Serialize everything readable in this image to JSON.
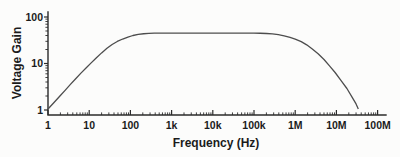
{
  "figure": {
    "background": "#fcfcfb",
    "axis_color": "#2b2b2b",
    "curve_color": "#4d4d4d",
    "text_color": "#1b1b1b"
  },
  "chart_data": {
    "type": "line",
    "scale": "log-log",
    "title": "",
    "xlabel": "Frequency (Hz)",
    "ylabel": "Voltage Gain",
    "x_tick_labels": [
      "1",
      "10",
      "100",
      "1k",
      "10k",
      "100k",
      "1M",
      "10M",
      "100M"
    ],
    "x_tick_values": [
      1,
      10,
      100,
      1000,
      10000,
      100000,
      1000000,
      10000000,
      100000000
    ],
    "y_tick_labels": [
      "1",
      "10",
      "100"
    ],
    "y_tick_values": [
      1,
      10,
      100
    ],
    "xlim": [
      1,
      100000000
    ],
    "ylim": [
      1,
      130
    ],
    "grid": false,
    "legend": false,
    "midband_gain": 45,
    "series": [
      {
        "name": "voltage-gain-response",
        "points": [
          [
            1,
            1.05
          ],
          [
            1.4,
            1.45
          ],
          [
            1.9,
            1.95
          ],
          [
            2.6,
            2.65
          ],
          [
            3.5,
            3.55
          ],
          [
            4.7,
            4.7
          ],
          [
            6.3,
            6.2
          ],
          [
            8.5,
            8.1
          ],
          [
            11,
            10.2
          ],
          [
            15,
            13.3
          ],
          [
            20,
            16.9
          ],
          [
            27,
            21.2
          ],
          [
            36,
            25.6
          ],
          [
            48,
            29.8
          ],
          [
            65,
            33.6
          ],
          [
            87,
            36.9
          ],
          [
            115,
            40.0
          ],
          [
            155,
            42.2
          ],
          [
            210,
            43.6
          ],
          [
            280,
            44.4
          ],
          [
            380,
            44.8
          ],
          [
            520,
            45
          ],
          [
            700,
            45
          ],
          [
            1000,
            45
          ],
          [
            3000,
            45
          ],
          [
            10000,
            45
          ],
          [
            30000,
            45
          ],
          [
            70000,
            45
          ],
          [
            100000,
            44.9
          ],
          [
            140000,
            44.7
          ],
          [
            200000,
            44.2
          ],
          [
            280000,
            43.2
          ],
          [
            390000,
            41.6
          ],
          [
            540000,
            39.4
          ],
          [
            750000,
            36.6
          ],
          [
            1000000,
            33.6
          ],
          [
            1400000,
            29.6
          ],
          [
            1900000,
            25.2
          ],
          [
            2600000,
            20.6
          ],
          [
            3600000,
            16.2
          ],
          [
            5000000,
            12.2
          ],
          [
            6800000,
            8.9
          ],
          [
            9300000,
            6.4
          ],
          [
            13000000,
            4.3
          ],
          [
            18000000,
            2.9
          ],
          [
            24000000,
            1.9
          ],
          [
            30000000,
            1.35
          ],
          [
            34000000,
            1.05
          ]
        ]
      }
    ]
  }
}
